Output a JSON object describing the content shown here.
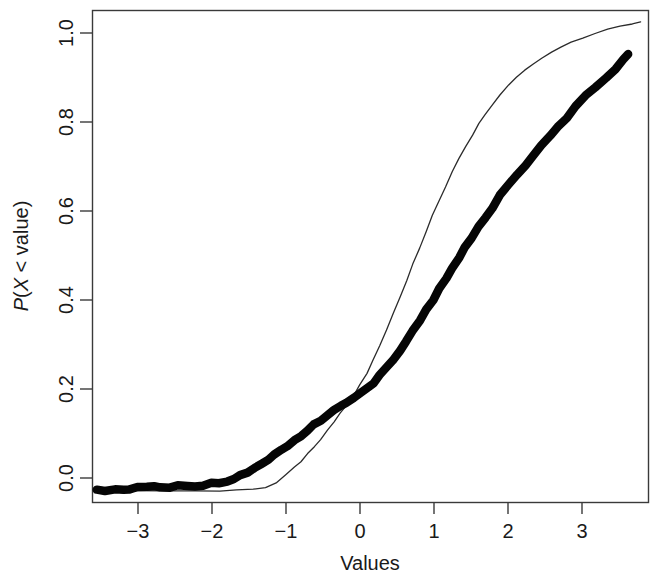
{
  "chart_data": {
    "type": "line",
    "title": "",
    "subtitle": "",
    "xlabel": "Values",
    "ylabel": "P(X < value)",
    "ylabel_parts": {
      "p": "P",
      "open": "(",
      "x": "X",
      "op": " < ",
      "value": "value",
      "close": ")"
    },
    "xlim": [
      -3.45,
      3.3
    ],
    "ylim": [
      -0.02,
      1.02
    ],
    "xticks": [
      -3,
      -2,
      -1,
      0,
      1,
      2,
      3
    ],
    "xtick_labels": [
      "−3",
      "−2",
      "−1",
      "0",
      "1",
      "2",
      "3"
    ],
    "yticks": [
      0.0,
      0.2,
      0.4,
      0.6,
      0.8,
      1.0
    ],
    "ytick_labels": [
      "0.0",
      "0.2",
      "0.4",
      "0.6",
      "0.8",
      "1.0"
    ],
    "grid": false,
    "legend": "none",
    "colors": {
      "empirical": "#050505",
      "theoretical": "#2b2b2b",
      "frame": "#3a3a3a",
      "background": "#ffffff"
    },
    "series": [
      {
        "name": "empirical-ecdf",
        "style": "thick-dotted",
        "marker": "filled-circle",
        "linewidth": 8.5,
        "x": [
          -3.4,
          -3.3,
          -3.18,
          -3.08,
          -3.0,
          -2.9,
          -2.8,
          -2.7,
          -2.62,
          -2.52,
          -2.42,
          -2.3,
          -2.2,
          -2.1,
          -2.0,
          -1.92,
          -1.82,
          -1.74,
          -1.65,
          -1.56,
          -1.48,
          -1.4,
          -1.32,
          -1.24,
          -1.16,
          -1.08,
          -1.0,
          -0.92,
          -0.84,
          -0.76,
          -0.68,
          -0.6,
          -0.52,
          -0.44,
          -0.36,
          -0.28,
          -0.2,
          -0.12,
          -0.04,
          0.04,
          0.12,
          0.2,
          0.28,
          0.36,
          0.44,
          0.52,
          0.6,
          0.68,
          0.76,
          0.84,
          0.92,
          1.0,
          1.08,
          1.16,
          1.24,
          1.32,
          1.4,
          1.5,
          1.6,
          1.7,
          1.8,
          1.9,
          2.0,
          2.1,
          2.2,
          2.3,
          2.42,
          2.54,
          2.66,
          2.78,
          2.9,
          3.0,
          3.05
        ],
        "y": [
          0.005,
          0.006,
          0.007,
          0.008,
          0.009,
          0.01,
          0.01,
          0.011,
          0.012,
          0.012,
          0.013,
          0.014,
          0.015,
          0.016,
          0.018,
          0.021,
          0.025,
          0.03,
          0.036,
          0.043,
          0.051,
          0.06,
          0.07,
          0.08,
          0.09,
          0.1,
          0.11,
          0.12,
          0.131,
          0.142,
          0.152,
          0.162,
          0.172,
          0.182,
          0.192,
          0.201,
          0.21,
          0.22,
          0.232,
          0.247,
          0.263,
          0.281,
          0.3,
          0.32,
          0.341,
          0.363,
          0.385,
          0.408,
          0.43,
          0.452,
          0.474,
          0.497,
          0.519,
          0.541,
          0.563,
          0.584,
          0.604,
          0.628,
          0.651,
          0.673,
          0.694,
          0.715,
          0.735,
          0.755,
          0.775,
          0.794,
          0.816,
          0.838,
          0.858,
          0.876,
          0.895,
          0.917,
          0.93
        ]
      },
      {
        "name": "theoretical-cdf",
        "style": "thin-line",
        "marker": "none",
        "linewidth": 1.3,
        "x": [
          -3.4,
          -3.0,
          -2.6,
          -2.2,
          -1.9,
          -1.7,
          -1.5,
          -1.35,
          -1.22,
          -1.1,
          -1.0,
          -0.92,
          -0.84,
          -0.76,
          -0.68,
          -0.6,
          -0.52,
          -0.44,
          -0.36,
          -0.28,
          -0.2,
          -0.12,
          -0.04,
          0.04,
          0.12,
          0.2,
          0.28,
          0.36,
          0.44,
          0.52,
          0.6,
          0.68,
          0.76,
          0.84,
          0.92,
          1.0,
          1.08,
          1.16,
          1.24,
          1.32,
          1.4,
          1.5,
          1.6,
          1.7,
          1.8,
          1.9,
          2.0,
          2.12,
          2.24,
          2.36,
          2.5,
          2.65,
          2.8,
          2.95,
          3.1,
          3.2
        ],
        "y": [
          0.003,
          0.003,
          0.003,
          0.004,
          0.004,
          0.005,
          0.007,
          0.012,
          0.022,
          0.038,
          0.053,
          0.066,
          0.081,
          0.097,
          0.113,
          0.131,
          0.149,
          0.167,
          0.186,
          0.206,
          0.228,
          0.252,
          0.28,
          0.311,
          0.344,
          0.378,
          0.412,
          0.447,
          0.482,
          0.517,
          0.551,
          0.585,
          0.617,
          0.648,
          0.678,
          0.706,
          0.732,
          0.757,
          0.78,
          0.801,
          0.82,
          0.842,
          0.861,
          0.878,
          0.893,
          0.907,
          0.919,
          0.932,
          0.943,
          0.953,
          0.963,
          0.972,
          0.98,
          0.987,
          0.993,
          0.997
        ]
      }
    ],
    "annotations": []
  }
}
